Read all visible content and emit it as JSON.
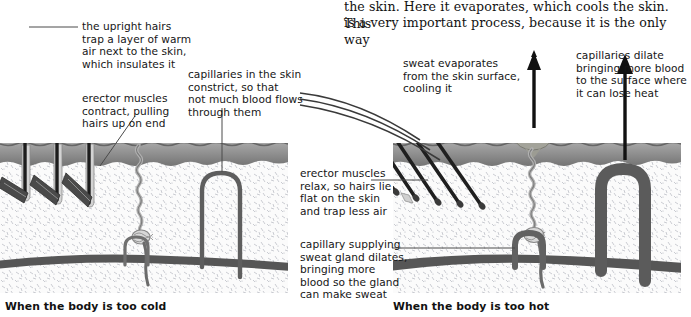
{
  "page": {
    "width": 681,
    "height": 317,
    "background": "#ffffff"
  },
  "body_text": {
    "line1": "the skin. Here it evaporates, which cools the skin. This",
    "line2": "is a very important process, because it is the only way"
  },
  "figure_left": {
    "caption": "When the body is too cold",
    "annotations": [
      {
        "id": "upright-hairs",
        "text": "the upright hairs\ntrap a layer of warm\nair next to the skin,\nwhich insulates it"
      },
      {
        "id": "erector-contract",
        "text": "erector muscles\ncontract, pulling\nhairs up on end"
      },
      {
        "id": "capillaries-constrict",
        "text": "capillaries in the skin\nconstrict, so that\nnot much blood flows\nthrough them"
      }
    ]
  },
  "figure_right": {
    "caption": "When the body is too hot",
    "annotations": [
      {
        "id": "sweat-evaporates",
        "text": "sweat evaporates\nfrom the skin surface,\ncooling it"
      },
      {
        "id": "capillaries-dilate",
        "text": "capillaries dilate\nbringing more blood\nto the surface where\nit can lose heat"
      },
      {
        "id": "erector-relax",
        "text": "erector muscles\nrelax, so hairs lie\nflat on the skin\nand trap less air"
      },
      {
        "id": "capillary-supplying",
        "text": "capillary supplying\nsweat gland dilates,\nbringing more\nblood so the gland\ncan make sweat"
      }
    ]
  },
  "colors": {
    "epidermis": "#8d8d8d",
    "dermis": "#f2f2f2",
    "vessel": "#595959",
    "hair": "#2b2b2b",
    "muscle": "#4a4a4a",
    "arrow": "#111111",
    "droplet": "#9a9a92",
    "leader": "#4a4a4a"
  }
}
